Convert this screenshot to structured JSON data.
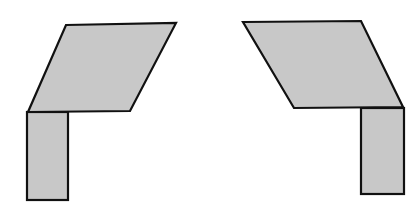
{
  "diagram": {
    "fill_color": "#c8c8c8",
    "stroke_color": "#111111",
    "shapes": [
      {
        "name": "left-figure",
        "parallelogram": "66,25 176,23 130,111 28,112",
        "rectangle": {
          "x": 27,
          "y": 112,
          "w": 41,
          "h": 88
        }
      },
      {
        "name": "right-figure",
        "parallelogram": "243,22 361,21 403,107 294,108",
        "rectangle": {
          "x": 361,
          "y": 108,
          "w": 43,
          "h": 86
        }
      }
    ]
  }
}
